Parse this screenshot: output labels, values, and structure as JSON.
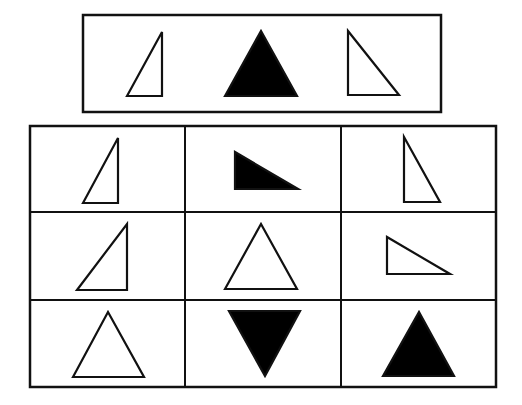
{
  "puzzle": {
    "stroke_color": "#111111",
    "fill_color": "#000000",
    "background": "#ffffff",
    "top_row": {
      "box": {
        "x": 83,
        "y": 15,
        "w": 358,
        "h": 97
      },
      "shapes": [
        {
          "label": "right-triangle-outline",
          "points": "127,96 162,32 162,96",
          "filled": false
        },
        {
          "label": "equilateral-triangle-filled",
          "points": "225,96 261,31 297,96",
          "filled": true
        },
        {
          "label": "right-triangle-outline-mirrored",
          "points": "348,31 348,95 399,95",
          "filled": false
        }
      ]
    },
    "grid": {
      "box": {
        "x": 30,
        "y": 126,
        "w": 466,
        "h": 261
      },
      "col_lines": [
        185,
        341
      ],
      "row_lines": [
        212,
        300
      ],
      "cells": [
        {
          "label": "r1c1-right-triangle-outline",
          "points": "83,203 118,138 118,203",
          "filled": false
        },
        {
          "label": "r1c2-right-triangle-filled-rotated",
          "points": "235,152 235,189 298,189",
          "filled": true
        },
        {
          "label": "r1c3-right-triangle-outline-mirrored",
          "points": "404,137 404,202 440,202",
          "filled": false
        },
        {
          "label": "r2c1-right-triangle-outline",
          "points": "77,290 127,224 127,290",
          "filled": false
        },
        {
          "label": "r2c2-equilateral-triangle-outline",
          "points": "225,289 261,224 297,289",
          "filled": false
        },
        {
          "label": "r2c3-right-triangle-outline-rotated",
          "points": "387,237 387,274 450,274",
          "filled": false
        },
        {
          "label": "r3c1-equilateral-triangle-outline",
          "points": "73,377 108,312 144,377",
          "filled": false
        },
        {
          "label": "r3c2-inverted-triangle-filled",
          "points": "229,311 300,311 265,376",
          "filled": true
        },
        {
          "label": "r3c3-equilateral-triangle-filled",
          "points": "383,376 419,312 454,376",
          "filled": true
        }
      ]
    }
  }
}
